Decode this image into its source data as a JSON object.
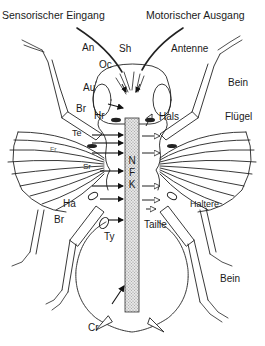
{
  "headers": {
    "left": "Sensorischer Eingang",
    "right": "Motorischer Ausgang"
  },
  "labels_left": {
    "an": "An",
    "oc": "Oc",
    "sh": "Sh",
    "au": "Au",
    "br_upper": "Br",
    "hr": "Hr",
    "te": "Te",
    "fr": "Fr",
    "sr": "Sr",
    "ha": "Ha",
    "br_lower": "Br",
    "ty": "Ty",
    "cr": "Cr"
  },
  "labels_right": {
    "antenne": "Antenne",
    "bein_upper": "Bein",
    "hals": "Hals",
    "fluegel": "Flügel",
    "haltere": "Haltere",
    "taille": "Taille",
    "bein_lower": "Bein"
  },
  "nerve_cord": {
    "letters": [
      "N",
      "F",
      "K"
    ],
    "fill_color": "#c8c8c8"
  },
  "arrows": {
    "sensory_count": 8,
    "motor_count": 7
  }
}
